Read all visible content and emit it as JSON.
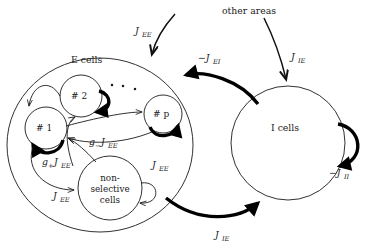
{
  "figure": {
    "kind": "neural-circuit-diagram",
    "background_color": "#ffffff",
    "ink_color": "#1a1a1a",
    "width": 382,
    "height": 249
  },
  "regions": {
    "excitatory": {
      "label": "E cells"
    },
    "inhibitory": {
      "label": "I cells"
    },
    "external": {
      "label": "other areas"
    }
  },
  "populations": [
    {
      "id": "p1",
      "label": "# 1"
    },
    {
      "id": "p2",
      "label": "# 2"
    },
    {
      "id": "pp",
      "label": "# p"
    },
    {
      "id": "ns",
      "label_line1": "non-",
      "label_line2": "selective",
      "label_line3": "cells"
    }
  ],
  "ellipsis": {
    "glyph": "·"
  },
  "connections": {
    "ext_to_e": "J",
    "ext_to_e_sub": "EE",
    "ext_to_i": "J",
    "ext_to_i_sub": "IE",
    "i_to_e": "−J",
    "i_to_e_sub": "EI",
    "e_to_i": "J",
    "e_to_i_sub": "IE",
    "i_to_i": "−J",
    "i_to_i_sub": "II",
    "potentiated": "g",
    "potentiated_sign": "+",
    "potentiated_J": "J",
    "potentiated_sub": "EE",
    "depressed": "g",
    "depressed_sign": "−",
    "depressed_J": "J",
    "depressed_sub": "EE",
    "baseline": "J",
    "baseline_sub": "EE",
    "ns_self": "J",
    "ns_self_sub": "EE"
  }
}
